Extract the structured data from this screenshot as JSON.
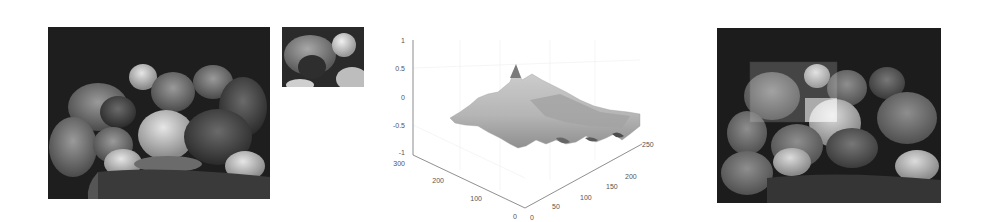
{
  "figure": {
    "panels": [
      {
        "id": "original",
        "description": "grayscale peppers image"
      },
      {
        "id": "template",
        "description": "cropped template patch"
      },
      {
        "id": "correlation_surface",
        "description": "3D normalized cross-correlation surface"
      },
      {
        "id": "match_result",
        "description": "peppers image with matched region highlighted"
      }
    ]
  },
  "surface_plot": {
    "z_ticks": [
      "1",
      "0.5",
      "0",
      "-0.5",
      "-1"
    ],
    "y_ticks": [
      "300",
      "200",
      "100",
      "0"
    ],
    "x_ticks": [
      "0",
      "50",
      "100",
      "150",
      "200",
      "250"
    ],
    "zlim": [
      -1,
      1
    ],
    "colors": {
      "axis": "#777777",
      "surface_light": "#c8c8c8",
      "surface_mid": "#a9a9a9",
      "surface_dark": "#555555",
      "grid": "#eeeeee"
    }
  },
  "match_box": {
    "x": 33,
    "y": 34,
    "width": 87,
    "height": 60
  }
}
